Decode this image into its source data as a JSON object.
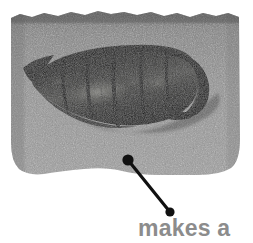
{
  "figure": {
    "kind": "specimen-photograph-with-callout",
    "caption": {
      "text": "makes a",
      "color": "#8c8c8c"
    },
    "page_background": "#ffffff",
    "panel": {
      "name": "specimen-photo-panel",
      "x": 10,
      "y": 11,
      "width": 231,
      "height": 166,
      "background_color": "#8f8f8f",
      "background_color_dark": "#6e6e6e",
      "texture": "halftone-noise",
      "edge_style": "ragged-torn-top-rounded-bottom"
    },
    "specimen": {
      "name": "fossil-shell-specimen",
      "description": "dark elongated ribbed gastropod shell",
      "body_color": "#191919",
      "highlight_color": "#6b6b6b",
      "shadow_color": "#000000",
      "rib_count": 5,
      "apex_side": "left",
      "aperture_side": "right"
    },
    "callout": {
      "name": "callout-leader-line",
      "color": "#111111",
      "line_width": 3,
      "anchor_dot": {
        "x": 128,
        "y": 160,
        "r": 5.5
      },
      "label_dot": {
        "x": 170,
        "y": 212,
        "r": 4.5
      }
    }
  }
}
